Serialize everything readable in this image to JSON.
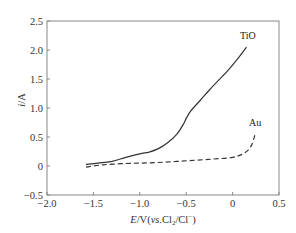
{
  "chart_data": {
    "type": "line",
    "title": "",
    "xlabel": "E/V(vs.Cl2/Cl−)",
    "xlabel_parts": {
      "var": "E",
      "unit": "/V(",
      "vs": "vs.",
      "species": "Cl",
      "sub": "2",
      "rest": "/Cl",
      "sup": "−",
      "close": ")"
    },
    "ylabel": "i/A",
    "ylabel_parts": {
      "var": "i",
      "unit": "/A"
    },
    "xlim": [
      -2.0,
      0.5
    ],
    "ylim": [
      -0.5,
      2.5
    ],
    "grid": false,
    "legend_position": "inline labels at curve ends",
    "x_ticks": [
      -2.0,
      -1.5,
      -1.0,
      -0.5,
      0,
      0.5
    ],
    "x_tick_labels": [
      "−2.0",
      "−1.5",
      "−1.0",
      "−0.5",
      "0",
      "0.5"
    ],
    "y_ticks": [
      -0.5,
      0,
      0.5,
      1.0,
      1.5,
      2.0,
      2.5
    ],
    "y_tick_labels": [
      "−0.5",
      "0",
      "0.5",
      "1.0",
      "1.5",
      "2.0",
      "2.5"
    ],
    "series": [
      {
        "name": "TiO",
        "style": "solid",
        "color": "#333333",
        "x": [
          -1.58,
          -1.45,
          -1.3,
          -1.15,
          -1.0,
          -0.9,
          -0.8,
          -0.7,
          -0.6,
          -0.53,
          -0.5,
          -0.45,
          -0.35,
          -0.25,
          -0.15,
          -0.05,
          0.05,
          0.15
        ],
        "y": [
          0.03,
          0.05,
          0.08,
          0.15,
          0.21,
          0.24,
          0.3,
          0.4,
          0.55,
          0.72,
          0.82,
          0.95,
          1.13,
          1.31,
          1.48,
          1.65,
          1.84,
          2.05
        ]
      },
      {
        "name": "Au",
        "style": "dashed",
        "color": "#333333",
        "x": [
          -1.58,
          -1.4,
          -1.2,
          -1.0,
          -0.8,
          -0.6,
          -0.4,
          -0.2,
          0.0,
          0.1,
          0.17,
          0.21,
          0.24
        ],
        "y": [
          -0.02,
          0.02,
          0.04,
          0.05,
          0.06,
          0.08,
          0.1,
          0.12,
          0.15,
          0.2,
          0.28,
          0.38,
          0.53
        ]
      }
    ],
    "annotations": [
      {
        "text": "TiO",
        "x": 0.2,
        "y": 2.2
      },
      {
        "text": "Au",
        "x": 0.28,
        "y": 0.75
      }
    ]
  },
  "labels": {
    "series_tio": "TiO",
    "series_au": "Au"
  }
}
